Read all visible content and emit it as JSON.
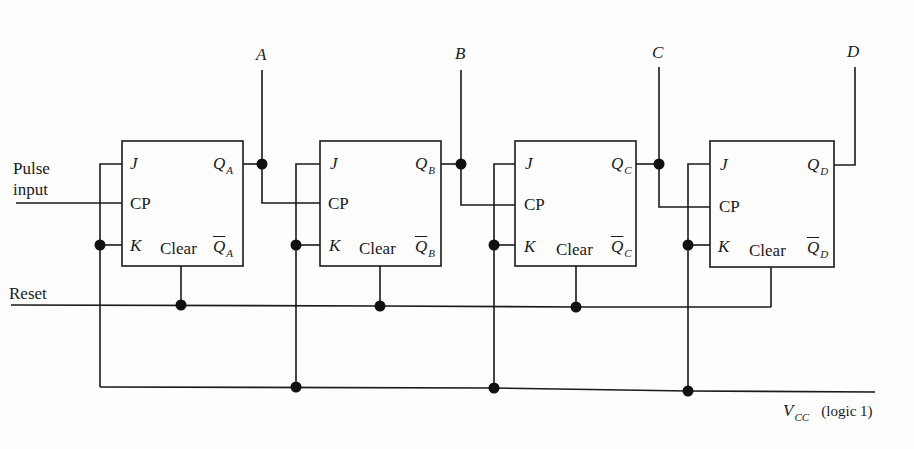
{
  "diagram": {
    "inputs": {
      "pulse_line1": "Pulse",
      "pulse_line2": "input",
      "reset": "Reset",
      "vcc_main": "V",
      "vcc_sub": "CC",
      "vcc_note": "(logic 1)"
    },
    "outputs": [
      "A",
      "B",
      "C",
      "D"
    ],
    "flipflops": [
      {
        "j": "J",
        "cp": "CP",
        "k": "K",
        "clear": "Clear",
        "q": "Q",
        "q_sub": "A",
        "qbar": "Q",
        "qbar_sub": "A"
      },
      {
        "j": "J",
        "cp": "CP",
        "k": "K",
        "clear": "Clear",
        "q": "Q",
        "q_sub": "B",
        "qbar": "Q",
        "qbar_sub": "B"
      },
      {
        "j": "J",
        "cp": "CP",
        "k": "K",
        "clear": "Clear",
        "q": "Q",
        "q_sub": "C",
        "qbar": "Q",
        "qbar_sub": "C"
      },
      {
        "j": "J",
        "cp": "CP",
        "k": "K",
        "clear": "Clear",
        "q": "Q",
        "q_sub": "D",
        "qbar": "Q",
        "qbar_sub": "D"
      }
    ],
    "colors": {
      "line": "#1a1a1a",
      "background": "#fdfdfd"
    }
  }
}
